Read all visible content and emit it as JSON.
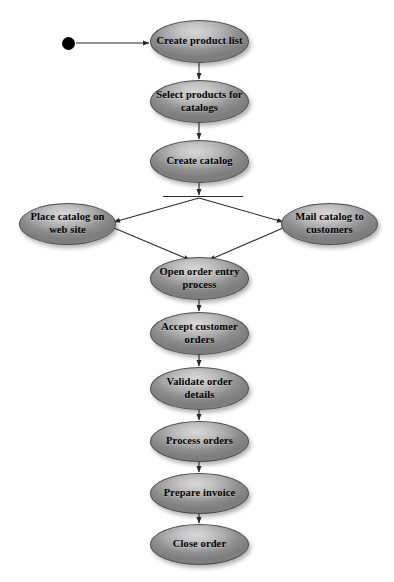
{
  "diagram": {
    "type": "uml-activity-diagram",
    "background_color": "#ffffff",
    "node_fill_color": "#a8a8a8",
    "node_border_color": "#4a4a4a",
    "edge_color": "#2b2b2b",
    "start_node_color": "#000000"
  },
  "start": {
    "name": "start-node",
    "cx": 68,
    "cy": 43,
    "r": 6.5
  },
  "fork": {
    "name": "fork-bar",
    "x": 163,
    "y": 195.5,
    "width": 80,
    "height": 1.5
  },
  "nodes": [
    {
      "id": "create-product-list",
      "label": "Create product list",
      "x": 150,
      "y": 20,
      "w": 99,
      "h": 43
    },
    {
      "id": "select-products",
      "label": "Select products for catalogs",
      "x": 150,
      "y": 80,
      "w": 99,
      "h": 43
    },
    {
      "id": "create-catalog",
      "label": "Create catalog",
      "x": 150,
      "y": 140,
      "w": 99,
      "h": 43
    },
    {
      "id": "place-catalog-web",
      "label": "Place catalog on web site",
      "x": 19,
      "y": 203,
      "w": 97,
      "h": 42
    },
    {
      "id": "mail-catalog-customers",
      "label": "Mail catalog to customers",
      "x": 281,
      "y": 203,
      "w": 97,
      "h": 42
    },
    {
      "id": "open-order-entry",
      "label": "Open order entry process",
      "x": 150,
      "y": 257,
      "w": 99,
      "h": 43
    },
    {
      "id": "accept-customer-orders",
      "label": "Accept customer orders",
      "x": 150,
      "y": 312,
      "w": 99,
      "h": 43
    },
    {
      "id": "validate-order-details",
      "label": "Validate order details",
      "x": 150,
      "y": 367,
      "w": 99,
      "h": 43
    },
    {
      "id": "process-orders",
      "label": "Process orders",
      "x": 150,
      "y": 421,
      "w": 99,
      "h": 41
    },
    {
      "id": "prepare-invoice",
      "label": "Prepare invoice",
      "x": 150,
      "y": 473,
      "w": 99,
      "h": 41
    },
    {
      "id": "close-order",
      "label": "Close order",
      "x": 150,
      "y": 524,
      "w": 99,
      "h": 41
    }
  ],
  "edges": [
    {
      "id": "edge-start-to-create-product-list",
      "from": "start",
      "to": "create-product-list",
      "x1": 76,
      "y1": 43,
      "x2": 149,
      "y2": 43,
      "arrow": true
    },
    {
      "id": "edge-create-product-list-to-select",
      "from": "create-product-list",
      "to": "select-products",
      "x1": 199,
      "y1": 63,
      "x2": 199,
      "y2": 79,
      "arrow": true
    },
    {
      "id": "edge-select-to-create-catalog",
      "from": "select-products",
      "to": "create-catalog",
      "x1": 199,
      "y1": 123,
      "x2": 199,
      "y2": 139,
      "arrow": true
    },
    {
      "id": "edge-create-catalog-to-fork",
      "from": "create-catalog",
      "to": "fork",
      "x1": 199,
      "y1": 183,
      "x2": 199,
      "y2": 195,
      "arrow": true
    },
    {
      "id": "edge-fork-to-place-catalog",
      "from": "fork",
      "to": "place-catalog-web",
      "x1": 199,
      "y1": 198,
      "x2": 114,
      "y2": 222,
      "arrow": true
    },
    {
      "id": "edge-fork-to-mail-catalog",
      "from": "fork",
      "to": "mail-catalog-customers",
      "x1": 199,
      "y1": 198,
      "x2": 283,
      "y2": 222,
      "arrow": true
    },
    {
      "id": "edge-place-catalog-to-open-order",
      "from": "place-catalog-web",
      "to": "open-order-entry",
      "x1": 114,
      "y1": 228,
      "x2": 190,
      "y2": 260,
      "arrow": true
    },
    {
      "id": "edge-mail-catalog-to-open-order",
      "from": "mail-catalog-customers",
      "to": "open-order-entry",
      "x1": 283,
      "y1": 228,
      "x2": 209,
      "y2": 260,
      "arrow": true
    },
    {
      "id": "edge-open-order-to-accept",
      "from": "open-order-entry",
      "to": "accept-customer-orders",
      "x1": 199,
      "y1": 300,
      "x2": 199,
      "y2": 311,
      "arrow": true
    },
    {
      "id": "edge-accept-to-validate",
      "from": "accept-customer-orders",
      "to": "validate-order-details",
      "x1": 199,
      "y1": 355,
      "x2": 199,
      "y2": 366,
      "arrow": true
    },
    {
      "id": "edge-validate-to-process",
      "from": "validate-order-details",
      "to": "process-orders",
      "x1": 199,
      "y1": 410,
      "x2": 199,
      "y2": 420,
      "arrow": true
    },
    {
      "id": "edge-process-to-prepare-invoice",
      "from": "process-orders",
      "to": "prepare-invoice",
      "x1": 199,
      "y1": 462,
      "x2": 199,
      "y2": 472,
      "arrow": true
    },
    {
      "id": "edge-prepare-invoice-to-close",
      "from": "prepare-invoice",
      "to": "close-order",
      "x1": 199,
      "y1": 514,
      "x2": 199,
      "y2": 523,
      "arrow": true
    }
  ]
}
